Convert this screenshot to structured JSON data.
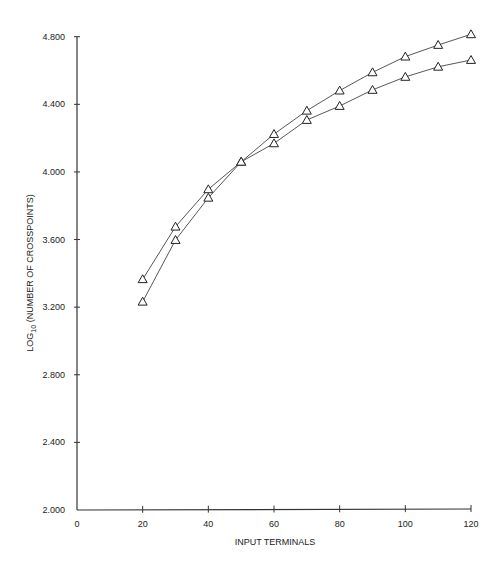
{
  "chart_data": {
    "type": "line",
    "title": "",
    "xlabel": "INPUT TERMINALS",
    "ylabel": "LOG10 (NUMBER OF CROSSPOINTS)",
    "ylabel_parts": {
      "prefix": "LOG",
      "subscript": "10",
      "suffix": " (NUMBER OF CROSSPOINTS)"
    },
    "xlim": [
      0,
      120
    ],
    "ylim": [
      2.0,
      4.8
    ],
    "x_ticks": [
      0,
      20,
      40,
      60,
      80,
      100,
      120
    ],
    "x_tick_labels": [
      "0",
      "20",
      "40",
      "60",
      "80",
      "100",
      "120"
    ],
    "y_ticks": [
      2.0,
      2.4,
      2.8,
      3.2,
      3.6,
      4.0,
      4.4,
      4.8
    ],
    "y_tick_labels": [
      "2.000",
      "2.400",
      "2.800",
      "3.200",
      "3.600",
      "4.000",
      "4.400",
      "4.800"
    ],
    "grid": false,
    "legend": null,
    "marker": "triangle-open",
    "x": [
      20,
      30,
      40,
      50,
      60,
      70,
      80,
      90,
      100,
      110,
      120
    ],
    "series": [
      {
        "name": "upper-curve",
        "values": [
          3.365,
          3.676,
          3.897,
          4.06,
          4.224,
          4.362,
          4.481,
          4.589,
          4.682,
          4.751,
          4.814
        ]
      },
      {
        "name": "lower-curve",
        "values": [
          3.232,
          3.597,
          3.847,
          4.06,
          4.169,
          4.307,
          4.39,
          4.485,
          4.562,
          4.622,
          4.662
        ]
      }
    ]
  }
}
